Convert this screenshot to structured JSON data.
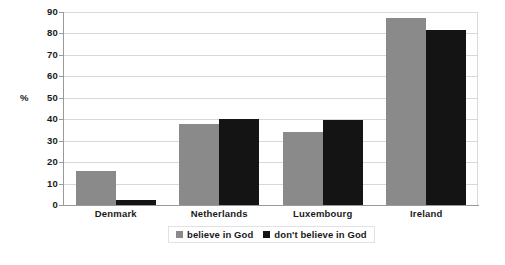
{
  "chart_data": {
    "type": "bar",
    "title": "",
    "subtitle": "",
    "xlabel": "",
    "ylabel": "%",
    "ylim": [
      0,
      90
    ],
    "ytick_step": 10,
    "yticks": [
      90,
      80,
      70,
      60,
      50,
      40,
      30,
      20,
      10,
      0
    ],
    "grid": true,
    "grid_axis": "y",
    "legend_position": "bottom-center",
    "categories": [
      "Denmark",
      "Netherlands",
      "Luxembourg",
      "Ireland"
    ],
    "series": [
      {
        "name": "believe in God",
        "color": "#8a8a8a",
        "values": [
          16,
          38,
          34,
          87
        ]
      },
      {
        "name": "don't believe in God",
        "color": "#141414",
        "values": [
          2.5,
          40,
          39.5,
          81.5
        ]
      }
    ]
  },
  "legend": {
    "items": [
      {
        "label": "believe in God",
        "swatch": "legend-swatch-gray"
      },
      {
        "label": "don't believe in God",
        "swatch": "legend-swatch-black"
      }
    ]
  }
}
